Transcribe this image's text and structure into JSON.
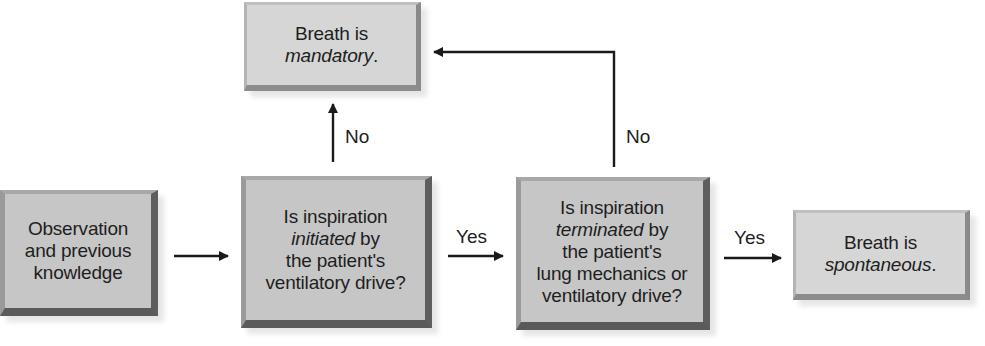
{
  "diagram": {
    "type": "flowchart",
    "nodes": {
      "observation": {
        "line1": "Observation",
        "line2": "and previous",
        "line3": "knowledge"
      },
      "mandatory": {
        "line1": "Breath is",
        "line2_italic": "mandatory",
        "line2_suffix": "."
      },
      "initiated": {
        "line1": "Is inspiration",
        "line2_italic": "initiated",
        "line2_suffix": " by",
        "line3": "the patient's",
        "line4": "ventilatory drive?"
      },
      "terminated": {
        "line1": "Is inspiration",
        "line2_italic": "terminated",
        "line2_suffix": " by",
        "line3": "the patient's",
        "line4": "lung mechanics or",
        "line5": "ventilatory drive?"
      },
      "spontaneous": {
        "line1": "Breath is",
        "line2_italic": "spontaneous",
        "line2_suffix": "."
      }
    },
    "edges": {
      "initiated_to_mandatory": "No",
      "initiated_to_terminated": "Yes",
      "terminated_to_mandatory": "No",
      "terminated_to_spontaneous": "Yes"
    },
    "colors": {
      "box_fill": "#c6c6c6",
      "box_fill_light": "#d6d6d6",
      "arrow": "#1a1a1a",
      "text": "#1e1e1e"
    }
  }
}
